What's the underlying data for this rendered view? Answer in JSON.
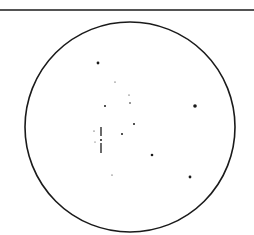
{
  "figure": {
    "kind": "telescope-eyepiece star field sketch",
    "colors": {
      "ink": "#1a1a1a",
      "background": "#ffffff"
    },
    "top_rule": {
      "y": 10,
      "x1": 0,
      "x2": 254
    },
    "field_circle": {
      "cx": 130,
      "cy": 127,
      "r": 105
    },
    "stars": [
      {
        "x": 98,
        "y": 63,
        "r": 1.4
      },
      {
        "x": 115,
        "y": 82,
        "r": 0.6
      },
      {
        "x": 129,
        "y": 95,
        "r": 0.6
      },
      {
        "x": 130,
        "y": 103,
        "r": 0.8
      },
      {
        "x": 105,
        "y": 106,
        "r": 1.0
      },
      {
        "x": 195,
        "y": 106,
        "r": 1.8
      },
      {
        "x": 134,
        "y": 124,
        "r": 1.0
      },
      {
        "x": 122,
        "y": 134,
        "r": 1.0
      },
      {
        "x": 94,
        "y": 131,
        "r": 0.6
      },
      {
        "x": 101,
        "y": 140,
        "r": 1.0
      },
      {
        "x": 95,
        "y": 142,
        "r": 0.5
      },
      {
        "x": 152,
        "y": 155,
        "r": 1.3
      },
      {
        "x": 112,
        "y": 175,
        "r": 0.6
      },
      {
        "x": 190,
        "y": 177,
        "r": 1.4
      }
    ],
    "streaks": [
      {
        "x": 101,
        "y1": 127,
        "y2": 136
      },
      {
        "x": 101,
        "y1": 143,
        "y2": 153
      }
    ]
  }
}
